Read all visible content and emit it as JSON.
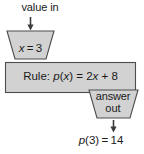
{
  "diagram": {
    "colors": {
      "shape_fill": "#d2d2d2",
      "shape_stroke": "#4d4d4d",
      "text": "#1a1a1a",
      "background": "#ffffff"
    },
    "top_label": "value in",
    "input_funnel": {
      "name": "input-funnel",
      "text_plain": "x = 3",
      "variable": "x",
      "relation": "=",
      "value": "3"
    },
    "rule_box": {
      "name": "rule-box",
      "text_plain": "Rule: p(x) = 2x + 8",
      "prefix": "Rule:",
      "function_name": "p",
      "argument": "x",
      "expression": "2x + 8"
    },
    "output_funnel": {
      "name": "output-funnel",
      "line1": "answer",
      "line2": "out"
    },
    "result": {
      "name": "result",
      "text_plain": "p(3) = 14",
      "function_name": "p",
      "input": "3",
      "output": "14"
    },
    "arrows": [
      {
        "name": "arrow-into-input-funnel",
        "direction": "down"
      },
      {
        "name": "arrow-out-of-output-funnel",
        "direction": "down"
      }
    ]
  }
}
